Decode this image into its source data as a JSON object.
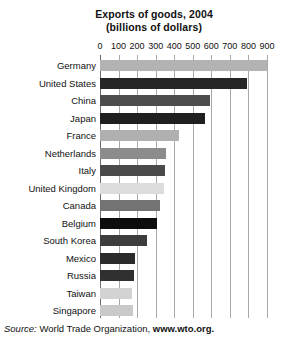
{
  "chart_data": {
    "type": "bar",
    "orientation": "horizontal",
    "title": "Exports of goods, 2004",
    "subtitle": "(billions of dollars)",
    "xlabel": "",
    "ylabel": "",
    "xlim": [
      0,
      900
    ],
    "xticks": [
      0,
      100,
      200,
      300,
      400,
      500,
      600,
      700,
      800,
      900
    ],
    "xtick_labels": [
      "0",
      "100",
      "200",
      "300",
      "400",
      "500",
      "600",
      "700",
      "800",
      "900"
    ],
    "grid": true,
    "legend": false,
    "categories": [
      "Germany",
      "United States",
      "China",
      "Japan",
      "France",
      "Netherlands",
      "Italy",
      "United Kingdom",
      "Canada",
      "Belgium",
      "South Korea",
      "Mexico",
      "Russia",
      "Taiwan",
      "Singapore"
    ],
    "values": [
      900,
      790,
      593,
      565,
      425,
      355,
      350,
      346,
      322,
      307,
      254,
      189,
      183,
      174,
      180
    ],
    "bar_colors": [
      "#b3b3b3",
      "#262626",
      "#4d4d4d",
      "#1f1f1f",
      "#b0b0b0",
      "#8c8c8c",
      "#4a4a4a",
      "#dcdcdc",
      "#737373",
      "#0d0d0d",
      "#3d3d3d",
      "#2b2b2b",
      "#303030",
      "#d2d2d2",
      "#c9c9c9"
    ],
    "annotations": []
  },
  "source": {
    "label": "Source:",
    "organization": "World Trade Organization,",
    "url": "www.wto.org."
  },
  "colors": {
    "gridline": "#a8a8a8",
    "axis": "#6e6e6e",
    "background": "#ffffff",
    "text": "#111111"
  }
}
